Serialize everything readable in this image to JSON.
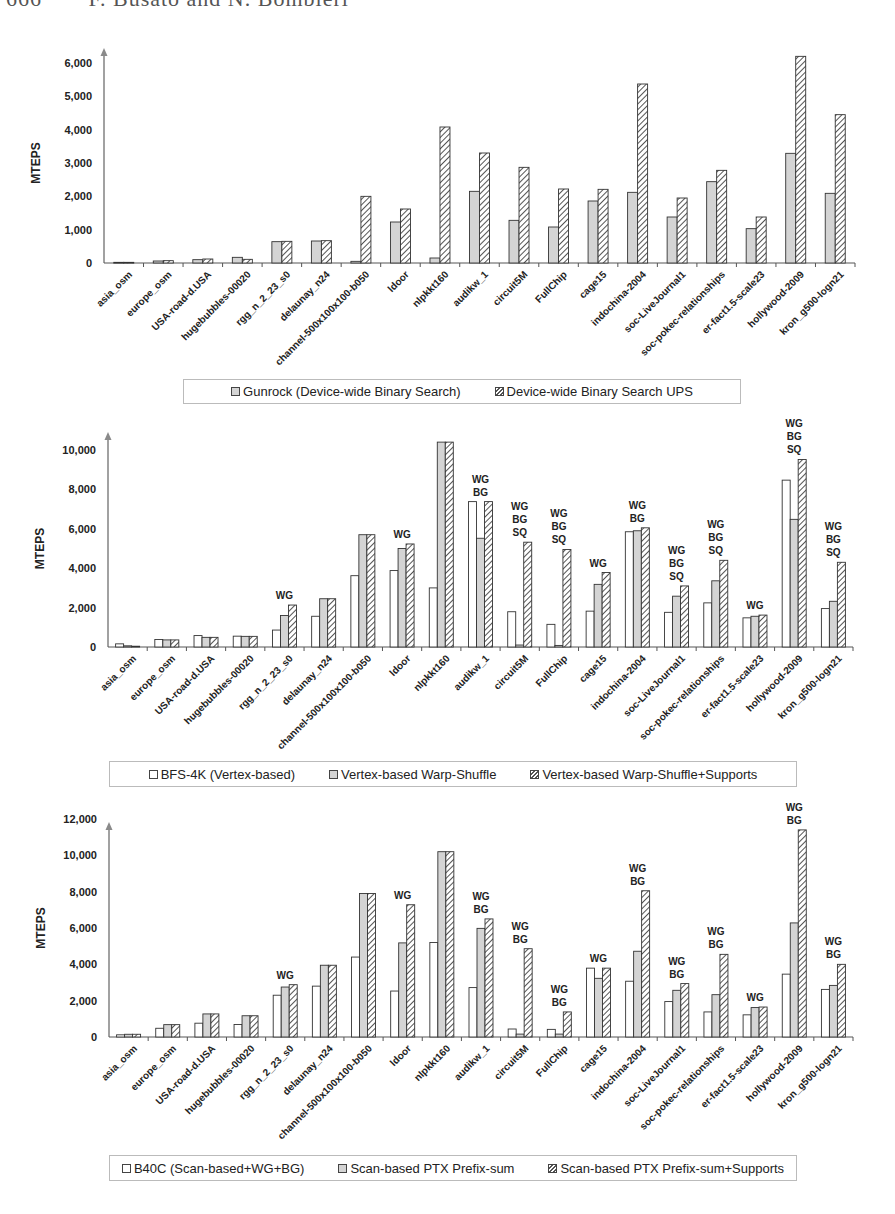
{
  "page_header": {
    "page_number": "666",
    "authors": "F. Busato and N. Bombieri"
  },
  "categories": [
    "asia_osm",
    "europe_osm",
    "USA-road-d.USA",
    "hugebubbles-00020",
    "rgg_n_2_23_s0",
    "delaunay_n24",
    "channel-500x100x100-b050",
    "ldoor",
    "nlpkkt160",
    "audikw_1",
    "circuit5M",
    "FullChip",
    "cage15",
    "indochina-2004",
    "soc-LiveJournal1",
    "soc-pokec-relationships",
    "er-fact1.5-scale23",
    "hollywood-2009",
    "kron_g500-logn21"
  ],
  "colors": {
    "axis": "#8a8a8a",
    "bar_border": "#333333",
    "gray_fill": "#d4d4d4",
    "hatch": "#555555"
  },
  "chart_data": [
    {
      "type": "bar",
      "title": "",
      "xlabel": "",
      "ylabel": "MTEPS",
      "ylim": [
        0,
        6000
      ],
      "yticks": [
        0,
        1000,
        2000,
        3000,
        4000,
        5000,
        6000
      ],
      "ytick_labels": [
        "0",
        "1,000",
        "2,000",
        "3,000",
        "4,000",
        "5,000",
        "6,000"
      ],
      "grid": false,
      "legend_position": "bottom",
      "categories": [
        "asia_osm",
        "europe_osm",
        "USA-road-d.USA",
        "hugebubbles-00020",
        "rgg_n_2_23_s0",
        "delaunay_n24",
        "channel-500x100x100-b050",
        "ldoor",
        "nlpkkt160",
        "audikw_1",
        "circuit5M",
        "FullChip",
        "cage15",
        "indochina-2004",
        "soc-LiveJournal1",
        "soc-pokec-relationships",
        "er-fact1.5-scale23",
        "hollywood-2009",
        "kron_g500-logn21"
      ],
      "series": [
        {
          "name": "Gunrock (Device-wide Binary Search)",
          "style": "gray",
          "values": [
            20,
            60,
            100,
            170,
            640,
            660,
            50,
            1230,
            150,
            2150,
            1280,
            1080,
            1860,
            2120,
            1380,
            2440,
            1030,
            3290,
            2090
          ]
        },
        {
          "name": "Device-wide Binary Search UPS",
          "style": "hatch",
          "values": [
            20,
            70,
            120,
            110,
            650,
            670,
            2000,
            1620,
            4080,
            3300,
            2870,
            2220,
            2210,
            5370,
            1950,
            2780,
            1380,
            6200,
            4450
          ]
        }
      ],
      "annotations": []
    },
    {
      "type": "bar",
      "title": "",
      "xlabel": "",
      "ylabel": "MTEPS",
      "ylim": [
        0,
        10000
      ],
      "yticks": [
        0,
        2000,
        4000,
        6000,
        8000,
        10000
      ],
      "ytick_labels": [
        "0",
        "2,000",
        "4,000",
        "6,000",
        "8,000",
        "10,000"
      ],
      "grid": false,
      "legend_position": "bottom",
      "categories": [
        "asia_osm",
        "europe_osm",
        "USA-road-d.USA",
        "hugebubbles-00020",
        "rgg_n_2_23_s0",
        "delaunay_n24",
        "channel-500x100x100-b050",
        "ldoor",
        "nlpkkt160",
        "audikw_1",
        "circuit5M",
        "FullChip",
        "cage15",
        "indochina-2004",
        "soc-LiveJournal1",
        "soc-pokec-relationships",
        "er-fact1.5-scale23",
        "hollywood-2009",
        "kron_g500-logn21"
      ],
      "series": [
        {
          "name": "BFS-4K (Vertex-based)",
          "style": "white",
          "values": [
            160,
            380,
            580,
            550,
            860,
            1560,
            3620,
            3880,
            3000,
            7380,
            1790,
            1150,
            1820,
            5850,
            1760,
            2240,
            1480,
            8470,
            1950
          ]
        },
        {
          "name": "Vertex-based Warp-Shuffle",
          "style": "gray",
          "values": [
            60,
            360,
            490,
            540,
            1600,
            2450,
            5700,
            5000,
            10400,
            5520,
            100,
            80,
            3180,
            5900,
            2580,
            3360,
            1560,
            6480,
            2320
          ]
        },
        {
          "name": "Vertex-based Warp-Shuffle+Supports",
          "style": "hatch",
          "values": [
            40,
            360,
            490,
            540,
            2130,
            2450,
            5700,
            5230,
            10400,
            7380,
            5320,
            4950,
            3780,
            6050,
            3100,
            4400,
            1620,
            9520,
            4300
          ]
        }
      ],
      "annotations": [
        "",
        "",
        "",
        "",
        "WG",
        "",
        "",
        "WG",
        "",
        "WG\nBG",
        "WG\nBG\nSQ",
        "WG\nBG\nSQ",
        "WG",
        "WG\nBG",
        "WG\nBG\nSQ",
        "WG\nBG\nSQ",
        "WG",
        "WG\nBG\nSQ",
        "WG\nBG\nSQ"
      ]
    },
    {
      "type": "bar",
      "title": "",
      "xlabel": "",
      "ylabel": "MTEPS",
      "ylim": [
        0,
        12000
      ],
      "yticks": [
        0,
        2000,
        4000,
        6000,
        8000,
        10000,
        12000
      ],
      "ytick_labels": [
        "0",
        "2,000",
        "4,000",
        "6,000",
        "8,000",
        "10,000",
        "12,000"
      ],
      "grid": false,
      "legend_position": "bottom",
      "categories": [
        "asia_osm",
        "europe_osm",
        "USA-road-d.USA",
        "hugebubbles-00020",
        "rgg_n_2_23_s0",
        "delaunay_n24",
        "channel-500x100x100-b050",
        "ldoor",
        "nlpkkt160",
        "audikw_1",
        "circuit5M",
        "FullChip",
        "cage15",
        "indochina-2004",
        "soc-LiveJournal1",
        "soc-pokec-relationships",
        "er-fact1.5-scale23",
        "hollywood-2009",
        "kron_g500-logn21"
      ],
      "series": [
        {
          "name": "B40C (Scan-based+WG+BG)",
          "style": "white",
          "values": [
            120,
            480,
            760,
            690,
            2300,
            2800,
            4400,
            2530,
            5200,
            2720,
            440,
            420,
            3790,
            3070,
            1950,
            1380,
            1220,
            3460,
            2620
          ]
        },
        {
          "name": "Scan-based PTX Prefix-sum",
          "style": "gray",
          "values": [
            150,
            680,
            1270,
            1170,
            2750,
            3950,
            7900,
            5180,
            10200,
            5980,
            160,
            160,
            3230,
            4720,
            2570,
            2330,
            1620,
            6280,
            2840
          ]
        },
        {
          "name": "Scan-based PTX Prefix-sum+Supports",
          "style": "hatch",
          "values": [
            150,
            680,
            1270,
            1170,
            2880,
            3950,
            7900,
            7280,
            10200,
            6500,
            4860,
            1380,
            3790,
            8050,
            2940,
            4550,
            1650,
            11400,
            4000
          ]
        }
      ],
      "annotations": [
        "",
        "",
        "",
        "",
        "WG",
        "",
        "",
        "WG",
        "",
        "WG\nBG",
        "WG\nBG",
        "WG\nBG",
        "WG",
        "WG\nBG",
        "WG\nBG",
        "WG\nBG",
        "WG",
        "WG\nBG",
        "WG\nBG"
      ]
    }
  ],
  "layout": [
    {
      "top": 0,
      "axis_x": 104,
      "zero_y": 263,
      "top_y": 63,
      "arrow_top": 48,
      "right_x": 855,
      "bar_w": 10,
      "label_y": 270,
      "legend": {
        "left": 183,
        "top": 379,
        "width": 556,
        "height": 23
      }
    },
    {
      "top": 0,
      "axis_x": 108,
      "zero_y": 647,
      "top_y": 450,
      "arrow_top": 432,
      "right_x": 853,
      "bar_w": 8,
      "label_y": 654,
      "legend": {
        "left": 109,
        "top": 761,
        "width": 686,
        "height": 24
      }
    },
    {
      "top": 0,
      "axis_x": 109,
      "zero_y": 1037,
      "top_y": 819,
      "arrow_top": 822,
      "right_x": 853,
      "bar_w": 8,
      "label_y": 1044,
      "legend": {
        "left": 109,
        "top": 1155,
        "width": 686,
        "height": 24
      }
    }
  ]
}
